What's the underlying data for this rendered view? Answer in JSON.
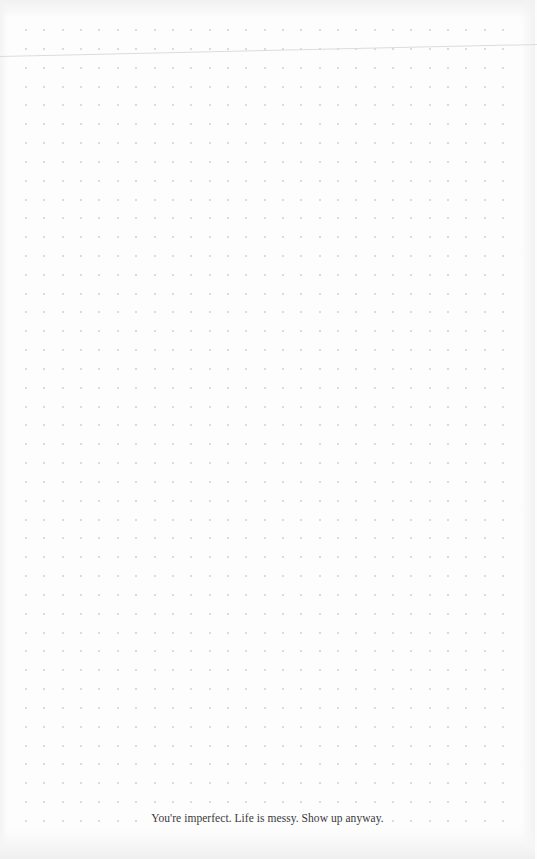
{
  "page": {
    "type": "dot-grid-notebook-page",
    "background_color": "#fdfdfd",
    "dot_color": "#cfcfcf",
    "line_color": "#dcdcdc",
    "grid": {
      "columns": 27,
      "rows": 43,
      "start_x": 26,
      "start_y": 30,
      "spacing_x": 18.35,
      "spacing_y": 18.83
    }
  },
  "footer": {
    "quote": "You're imperfect. Life is messy. Show up anyway."
  }
}
